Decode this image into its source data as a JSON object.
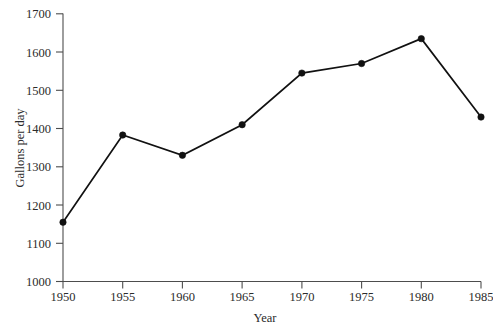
{
  "chart_data": {
    "type": "line",
    "title": "",
    "xlabel": "Year",
    "ylabel": "Gallons per day",
    "x": [
      1950,
      1955,
      1960,
      1965,
      1970,
      1975,
      1980,
      1985
    ],
    "values": [
      1155,
      1383,
      1330,
      1410,
      1545,
      1570,
      1635,
      1430
    ],
    "xtick_labels": [
      "1950",
      "1955",
      "1960",
      "1965",
      "1970",
      "1975",
      "1980",
      "1985"
    ],
    "ytick_labels": [
      "1000",
      "1100",
      "1200",
      "1300",
      "1400",
      "1500",
      "1600",
      "1700"
    ],
    "yticks": [
      1000,
      1100,
      1200,
      1300,
      1400,
      1500,
      1600,
      1700
    ],
    "xlim": [
      1950,
      1985
    ],
    "ylim": [
      1000,
      1700
    ],
    "grid": false,
    "legend": null,
    "marker": "filled-circle",
    "line_color": "#111111",
    "marker_color": "#111111",
    "axis_color": "#4d4d4d",
    "background_color": "#ffffff"
  },
  "axis": {
    "y_title": "Gallons per day",
    "x_title": "Year",
    "y_tick_0": "1000",
    "y_tick_1": "1100",
    "y_tick_2": "1200",
    "y_tick_3": "1300",
    "y_tick_4": "1400",
    "y_tick_5": "1500",
    "y_tick_6": "1600",
    "y_tick_7": "1700",
    "x_tick_0": "1950",
    "x_tick_1": "1955",
    "x_tick_2": "1960",
    "x_tick_3": "1965",
    "x_tick_4": "1970",
    "x_tick_5": "1975",
    "x_tick_6": "1980",
    "x_tick_7": "1985"
  }
}
